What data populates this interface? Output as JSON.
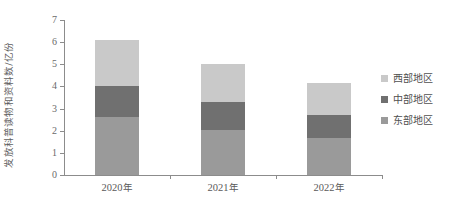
{
  "chart_data": {
    "type": "bar",
    "subtype": "stacked-bar",
    "title": "",
    "xlabel": "",
    "ylabel": "发放科普读物和资料数/亿份",
    "categories": [
      "2020年",
      "2021年",
      "2022年"
    ],
    "ylim": [
      0,
      7
    ],
    "ytick_labels": [
      "0",
      "1",
      "2",
      "3",
      "4",
      "5",
      "6",
      "7"
    ],
    "ytick_values": [
      0,
      1,
      2,
      3,
      4,
      5,
      6,
      7
    ],
    "grid": false,
    "legend_position": "right",
    "series": [
      {
        "name": "东部地区",
        "color": "#9a9a9a",
        "values": [
          2.6,
          2.05,
          1.65
        ]
      },
      {
        "name": "中部地区",
        "color": "#707070",
        "values": [
          1.4,
          1.25,
          1.05
        ]
      },
      {
        "name": "西部地区",
        "color": "#c9c9c9",
        "values": [
          2.1,
          1.7,
          1.45
        ]
      }
    ],
    "totals": [
      6.1,
      5.0,
      4.15
    ]
  },
  "legend": {
    "items": [
      {
        "label": "西部地区",
        "color": "#c9c9c9"
      },
      {
        "label": "中部地区",
        "color": "#707070"
      },
      {
        "label": "东部地区",
        "color": "#9a9a9a"
      }
    ]
  },
  "axis": {
    "line_color": "#8c8c8c"
  }
}
